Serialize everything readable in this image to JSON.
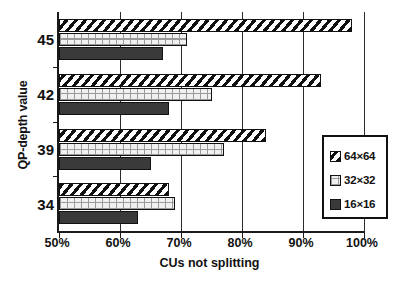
{
  "chart_data": {
    "type": "bar",
    "orientation": "horizontal",
    "title": "",
    "xlabel": "CUs not splitting",
    "ylabel": "QP-depth value",
    "categories": [
      "45",
      "42",
      "39",
      "34"
    ],
    "series": [
      {
        "name": "64×64",
        "values": [
          98,
          93,
          84,
          68
        ]
      },
      {
        "name": "32×32",
        "values": [
          71,
          75,
          77,
          69
        ]
      },
      {
        "name": "16×16",
        "values": [
          67,
          68,
          65,
          63
        ]
      }
    ],
    "xlim": [
      50,
      100
    ],
    "xticks": [
      50,
      60,
      70,
      80,
      90,
      100
    ],
    "xticklabels": [
      "50%",
      "60%",
      "70%",
      "80%",
      "90%",
      "100%"
    ],
    "grid": "vertical",
    "legend_position": "right-inside",
    "legend_entries": [
      "64×64",
      "32×32",
      "16×16"
    ],
    "colors": {
      "series_64x64": "#ffffff",
      "series_64x64_hatch": "#111111",
      "series_32x32": "#f0f0f0",
      "series_16x16": "#3a3a3a",
      "axis": "#1a1a1a",
      "grid": "#2b2b2b",
      "text": "#111111"
    }
  }
}
